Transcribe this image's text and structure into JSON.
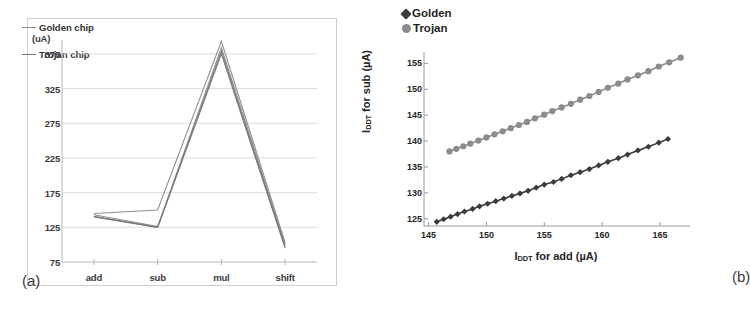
{
  "figure": {
    "panel_a_label": "(a)",
    "panel_b_label": "(b)"
  },
  "chart_data": [
    {
      "id": "panel_a",
      "type": "line",
      "title": "",
      "xlabel": "",
      "ylabel": "(uA)",
      "unit_label": "(uA)",
      "categories": [
        "add",
        "sub",
        "mul",
        "shift"
      ],
      "xticks": [
        "add",
        "sub",
        "mul",
        "shift"
      ],
      "yticks": [
        75,
        125,
        175,
        225,
        275,
        325,
        375
      ],
      "ylim": [
        75,
        395
      ],
      "grid": true,
      "legend_position": "inside-top-left",
      "legend": [
        "Golden chip",
        "Trojan chip"
      ],
      "colors": {
        "golden": "#8a8a8a",
        "trojan": "#767676"
      },
      "series": [
        {
          "name": "Golden chip",
          "color": "#8f8f8f",
          "values": [
            145,
            150,
            393,
            103
          ]
        },
        {
          "name": "Golden chip",
          "color": "#8f8f8f",
          "values": [
            143,
            126,
            384,
            100
          ]
        },
        {
          "name": "Trojan chip",
          "color": "#7a7a7a",
          "values": [
            141,
            125,
            379,
            97
          ]
        },
        {
          "name": "Trojan chip",
          "color": "#7a7a7a",
          "values": [
            140,
            125,
            375,
            95
          ]
        }
      ]
    },
    {
      "id": "panel_b",
      "type": "scatter",
      "title": "",
      "xlabel": "I_DDT for add (uA)",
      "xlabel_main": "I",
      "xlabel_sub": "DDT",
      "xlabel_rest": " for add (µA)",
      "ylabel": "I_DDT for sub (uA)",
      "ylabel_main": "I",
      "ylabel_sub": "DDT",
      "ylabel_rest": " for sub (µA)",
      "xticks": [
        145,
        150,
        155,
        160,
        165
      ],
      "yticks": [
        125,
        130,
        135,
        140,
        145,
        150,
        155
      ],
      "xlim": [
        144.6,
        167.6
      ],
      "ylim": [
        123.6,
        157.2
      ],
      "grid": false,
      "legend_position": "top-left",
      "legend": [
        {
          "label": "Golden",
          "marker": "diamond",
          "color": "#3b3b3b"
        },
        {
          "label": "Trojan",
          "marker": "circle",
          "color": "#8c8c8c"
        }
      ],
      "series": [
        {
          "name": "Golden",
          "marker": "diamond",
          "color": "#3b3b3b",
          "x": [
            145.7,
            146.3,
            146.9,
            147.5,
            148.1,
            148.8,
            149.4,
            150.1,
            150.8,
            151.5,
            152.2,
            152.9,
            153.6,
            154.3,
            155.0,
            155.8,
            156.5,
            157.3,
            158.1,
            158.9,
            159.7,
            160.5,
            161.4,
            162.2,
            163.1,
            164.0,
            164.9,
            165.7
          ],
          "y": [
            124.4,
            124.9,
            125.4,
            125.9,
            126.4,
            126.9,
            127.4,
            127.9,
            128.4,
            128.9,
            129.4,
            129.9,
            130.4,
            131.0,
            131.6,
            132.1,
            132.7,
            133.4,
            134.0,
            134.6,
            135.3,
            136.0,
            136.7,
            137.4,
            138.2,
            138.9,
            139.7,
            140.4
          ]
        },
        {
          "name": "Trojan",
          "marker": "circle",
          "color": "#8c8c8c",
          "x": [
            146.8,
            147.4,
            148.0,
            148.6,
            149.3,
            150.0,
            150.7,
            151.4,
            152.1,
            152.8,
            153.5,
            154.2,
            155.0,
            155.7,
            156.5,
            157.3,
            158.1,
            158.9,
            159.7,
            160.5,
            161.4,
            162.2,
            163.1,
            164.0,
            164.9,
            165.8,
            166.8
          ],
          "y": [
            138.0,
            138.5,
            139.0,
            139.5,
            140.1,
            140.7,
            141.3,
            141.9,
            142.5,
            143.1,
            143.7,
            144.4,
            145.1,
            145.8,
            146.5,
            147.2,
            148.0,
            148.7,
            149.5,
            150.3,
            151.1,
            151.9,
            152.7,
            153.5,
            154.4,
            155.2,
            156.1
          ]
        }
      ]
    }
  ]
}
